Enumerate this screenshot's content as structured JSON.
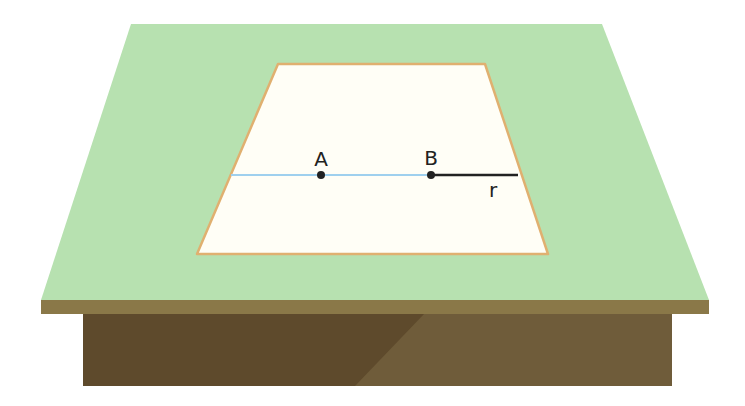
{
  "diagram": {
    "type": "3d-illustration",
    "points": [
      {
        "id": "A",
        "label": "A",
        "x": 321,
        "y": 175
      },
      {
        "id": "B",
        "label": "B",
        "x": 431,
        "y": 175
      }
    ],
    "segments": [
      {
        "id": "line-through-AB",
        "from_x": 231,
        "to_x": 431,
        "y": 175,
        "color": "#9fd0ee"
      },
      {
        "id": "radius-r",
        "from_x": 431,
        "to_x": 518,
        "y": 175,
        "color": "#222222",
        "label": "r"
      }
    ],
    "labels": {
      "A": "A",
      "B": "B",
      "r": "r"
    },
    "colors": {
      "tabletop": "#b7e1b0",
      "tabletop_edge": "#8a7848",
      "box_dark": "#5e4a2c",
      "box_light": "#6f5c3a",
      "sheet": "#fffef6",
      "sheet_border": "#e0b070",
      "blue_line": "#9fd0ee",
      "black_line": "#222222"
    }
  }
}
